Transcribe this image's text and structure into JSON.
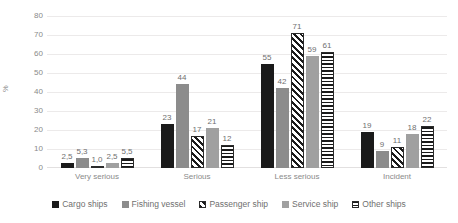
{
  "chart_data": {
    "type": "bar",
    "title": "",
    "subtitle": "",
    "xlabel": "",
    "ylabel": "%",
    "ylim": [
      0,
      80
    ],
    "yticks": [
      0,
      10,
      20,
      30,
      40,
      50,
      60,
      70,
      80
    ],
    "grid": true,
    "legend_position": "bottom",
    "categories": [
      "Very serious",
      "Serious",
      "Less serious",
      "Incident"
    ],
    "series": [
      {
        "name": "Cargo ships",
        "fill": "solid-black",
        "color": "#1a1a1a",
        "values": [
          2.5,
          23,
          55,
          19
        ],
        "labels": [
          "2,5",
          "23",
          "55",
          "19"
        ]
      },
      {
        "name": "Fishing vessel",
        "fill": "solid-gray",
        "color": "#8c8c8c",
        "values": [
          5.3,
          44,
          42,
          9
        ],
        "labels": [
          "5,3",
          "44",
          "42",
          "9"
        ]
      },
      {
        "name": "Passenger ship",
        "fill": "diagonal-stripes",
        "color": "#ffffff",
        "values": [
          1.0,
          17,
          71,
          11
        ],
        "labels": [
          "1,0",
          "17",
          "71",
          "11"
        ]
      },
      {
        "name": "Service ship",
        "fill": "solid-gray-light",
        "color": "#a0a0a0",
        "values": [
          2.5,
          21,
          59,
          18
        ],
        "labels": [
          "2,5",
          "21",
          "59",
          "18"
        ]
      },
      {
        "name": "Other ships",
        "fill": "horizontal-stripes",
        "color": "#ffffff",
        "values": [
          5.5,
          12,
          61,
          22
        ],
        "labels": [
          "5,5",
          "12",
          "61",
          "22"
        ]
      }
    ]
  }
}
